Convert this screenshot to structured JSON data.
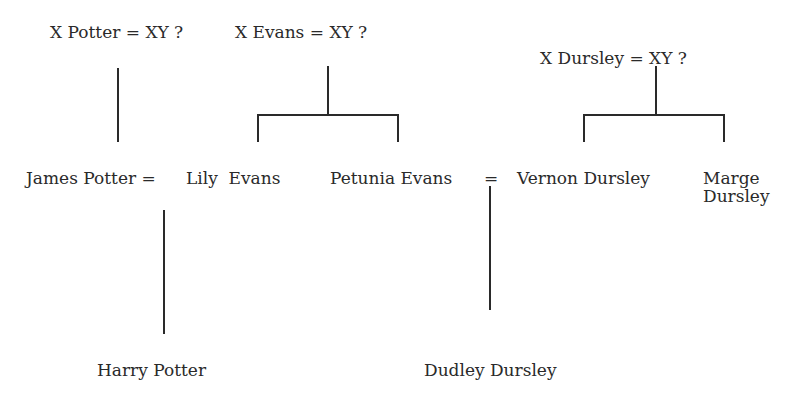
{
  "diagram": {
    "type": "family-tree",
    "background": "#ffffff",
    "line_color": "#2a2a2a",
    "ancestors": [
      {
        "label": "X Potter = XY ?"
      },
      {
        "label": "X Evans = XY ?"
      },
      {
        "label": "X Dursley = XY ?"
      }
    ],
    "generation2": {
      "james": "James Potter =",
      "lily": "Lily  Evans",
      "petunia": "Petunia Evans",
      "eq2": "=",
      "vernon": "Vernon Dursley",
      "marge_line1": "Marge",
      "marge_line2": "Dursley"
    },
    "children": [
      {
        "label": "Harry Potter"
      },
      {
        "label": "Dudley Dursley"
      }
    ]
  }
}
